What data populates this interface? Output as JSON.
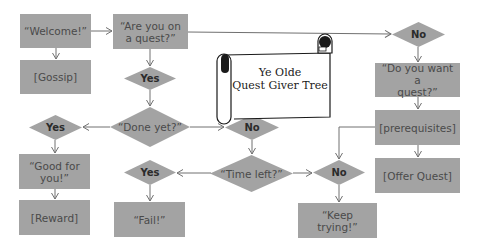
{
  "diagram": {
    "title": "Ye Olde Quest Giver Tree",
    "title_lines": [
      "Ye Olde",
      "Quest Giver Tree"
    ],
    "colors": {
      "node_fill": "#a3a3a3",
      "node_text": "#4a4a4a",
      "line": "#707070",
      "background": "#ffffff"
    },
    "nodes": {
      "welcome": "“Welcome!”",
      "gossip": "[Gossip]",
      "on_quest": [
        "“Are you on",
        "a quest?”"
      ],
      "yes_on_quest": "Yes",
      "done_yet": "“Done yet?”",
      "yes_done": "Yes",
      "good_for_you": [
        "“Good for",
        "you!”"
      ],
      "reward": "[Reward]",
      "no_done": "No",
      "time_left": "“Time left?”",
      "yes_time": "Yes",
      "fail": "“Fail!”",
      "no_time": "No",
      "keep_trying": "“Keep trying!”",
      "no_on_quest": "No",
      "want_quest": [
        "“Do you want a",
        "quest?”"
      ],
      "prerequisites": "[prerequisites]",
      "offer_quest": "[Offer Quest]"
    },
    "edges": [
      [
        "welcome",
        "gossip"
      ],
      [
        "welcome",
        "on_quest"
      ],
      [
        "on_quest",
        "yes_on_quest"
      ],
      [
        "on_quest",
        "no_on_quest"
      ],
      [
        "yes_on_quest",
        "done_yet"
      ],
      [
        "done_yet",
        "yes_done"
      ],
      [
        "done_yet",
        "no_done"
      ],
      [
        "yes_done",
        "good_for_you"
      ],
      [
        "good_for_you",
        "reward"
      ],
      [
        "no_done",
        "time_left"
      ],
      [
        "time_left",
        "yes_time"
      ],
      [
        "time_left",
        "no_time"
      ],
      [
        "yes_time",
        "fail"
      ],
      [
        "no_time",
        "keep_trying"
      ],
      [
        "no_on_quest",
        "want_quest"
      ],
      [
        "want_quest",
        "prerequisites"
      ],
      [
        "prerequisites",
        "offer_quest"
      ],
      [
        "prerequisites",
        "no_time"
      ]
    ]
  }
}
